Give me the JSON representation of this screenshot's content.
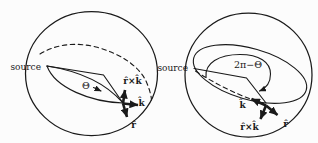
{
  "figure": {
    "ink_color": "#1a1a1a",
    "background_color": "#fcfcfc",
    "left_sphere": {
      "source_label": "source",
      "angle_label": "Θ",
      "vector_labels": {
        "up": "r̂×k̂",
        "right": "k̂",
        "down": "r̂"
      }
    },
    "right_sphere": {
      "source_label": "source",
      "angle_label": "2π−Θ",
      "vector_labels": {
        "up_left": "k̂",
        "down": "r̂×k̂",
        "down_right": "r̂"
      }
    }
  }
}
